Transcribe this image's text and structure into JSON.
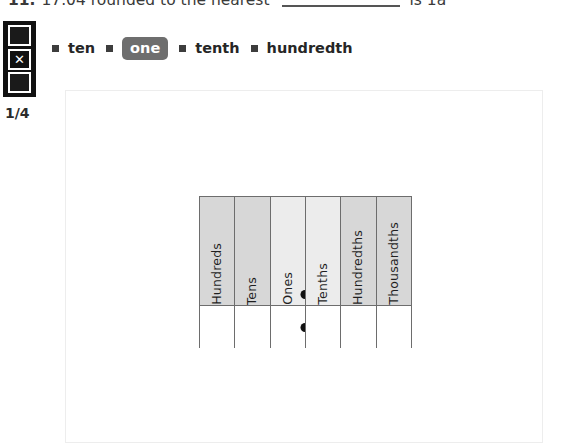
{
  "question": {
    "number": "11.",
    "text": "17.04 rounded to the nearest",
    "blank": "",
    "tail": "is 1a"
  },
  "navigation": {
    "prev_icon": "square-up-icon",
    "close_icon": "x-icon",
    "next_icon": "square-down-icon",
    "close_glyph": "✕",
    "page_counter": "1/4"
  },
  "choices": {
    "bullet_icon": "square-bullet-icon",
    "items": [
      {
        "label": "ten",
        "selected": false
      },
      {
        "label": "one",
        "selected": true
      },
      {
        "label": "tenth",
        "selected": false
      },
      {
        "label": "hundredth",
        "selected": false
      }
    ]
  },
  "place_value_chart": {
    "columns": [
      {
        "label": "Hundreds",
        "shade": "dark"
      },
      {
        "label": "Tens",
        "shade": "dark"
      },
      {
        "label": "Ones",
        "shade": "light"
      },
      {
        "label": "Tenths",
        "shade": "light"
      },
      {
        "label": "Hundredths",
        "shade": "dark"
      },
      {
        "label": "Thousandths",
        "shade": "dark"
      }
    ],
    "decimal_point_after_column": "Ones",
    "decimal_dots": 2
  },
  "colors": {
    "selected_pill": "#6e6e6e",
    "header_shade": "#d7d7d7",
    "header_shade_light": "#ececec",
    "chart_border": "#6d6d6d",
    "nav_widget": "#111111",
    "panel_border": "#ededed"
  }
}
